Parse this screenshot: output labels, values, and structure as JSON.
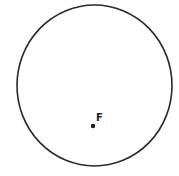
{
  "diagram": {
    "circle": {
      "cx": 94.5,
      "cy": 85.5,
      "rx": 77.5,
      "ry": 80.5,
      "stroke": "#2a2a2a",
      "stroke_width": 1.6
    },
    "points": [
      {
        "label": "F",
        "x": 93,
        "y": 126,
        "label_x": 96,
        "label_y": 121
      }
    ]
  }
}
